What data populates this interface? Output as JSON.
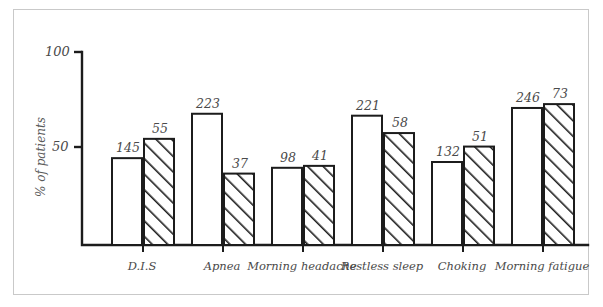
{
  "figure": {
    "y_axis_label": "% of patients",
    "y_ticks": [
      {
        "label": "100",
        "value": 100
      },
      {
        "label": "50",
        "value": 50
      }
    ]
  },
  "chart_data": {
    "type": "bar",
    "title": "",
    "xlabel": "",
    "ylabel": "% of patients",
    "ylim": [
      0,
      100
    ],
    "grid": false,
    "legend": "none",
    "categories": [
      "D.I.S",
      "Apnea",
      "Morning headache",
      "Restless sleep",
      "Choking",
      "Morning fatigue"
    ],
    "series": [
      {
        "name": "number of patients",
        "style": "white",
        "labels": [
          "145",
          "223",
          "98",
          "221",
          "132",
          "246"
        ],
        "values": [
          145,
          223,
          98,
          221,
          132,
          246
        ],
        "percent_heights": [
          45,
          68,
          40,
          67,
          43,
          71
        ]
      },
      {
        "name": "percent of patients",
        "style": "hatched",
        "labels": [
          "55",
          "37",
          "41",
          "58",
          "51",
          "73"
        ],
        "values": [
          55,
          37,
          41,
          58,
          51,
          73
        ],
        "percent_heights": [
          55,
          37,
          41,
          58,
          51,
          73
        ]
      }
    ]
  }
}
